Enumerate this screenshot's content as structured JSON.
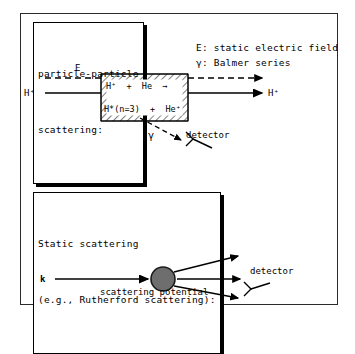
{
  "figure": {
    "title_top": "particle-particle scattering:",
    "title_bottom": "Static scattering (e.g., Rutherford scattering):"
  },
  "top_panel": {
    "callout": {
      "line1": "particle-particle",
      "line2": "scattering:"
    },
    "legend": {
      "line1": "E: static electric field",
      "line2": "γ: Balmer series"
    },
    "field_label": "E",
    "beam_in_label": "H⁺",
    "beam_out_label": "H⁺",
    "reaction_top": "H⁺  +  He  →",
    "reaction_bottom": "H*(n=3)  +  He⁺",
    "photon_label": "γ",
    "detector_label": "detector"
  },
  "bottom_panel": {
    "callout": {
      "line1": "Static scattering",
      "line2": "(e.g., Rutherford scattering):"
    },
    "wavevector_label": "k",
    "potential_label": "scattering potential",
    "detector_label": "detector"
  },
  "colors": {
    "ink": "#000000",
    "frame": "#2b2b2b",
    "potential_fill": "#6e6e6e",
    "potential_stroke": "#1a1a1a",
    "background": "#ffffff"
  }
}
